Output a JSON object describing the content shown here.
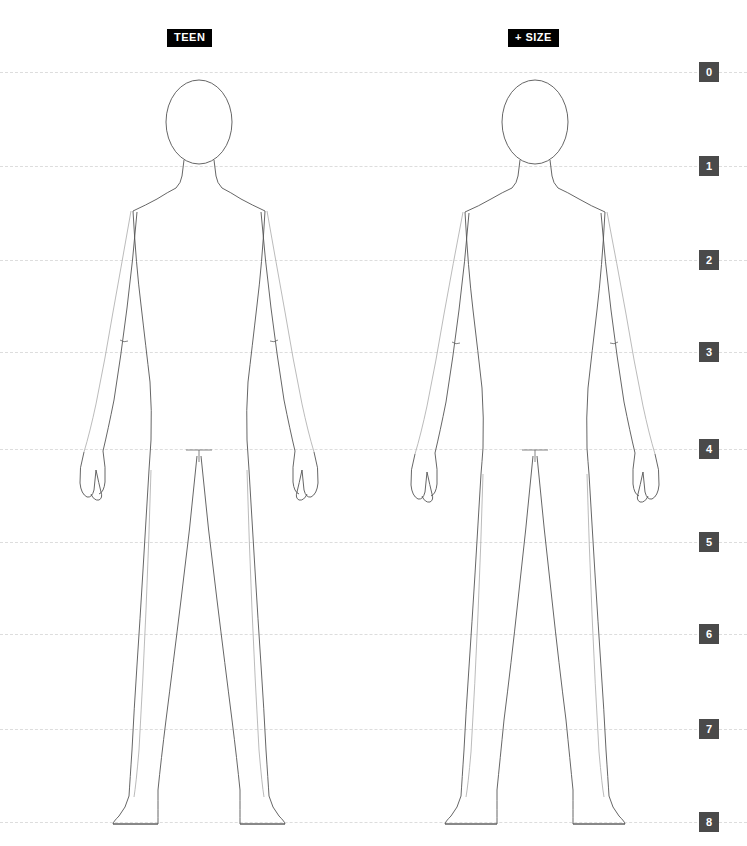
{
  "canvas": {
    "width": 747,
    "height": 846,
    "background": "#ffffff"
  },
  "style": {
    "marker_bg": "#4a4a4a",
    "marker_text": "#ffffff",
    "badge_bg": "#000000",
    "badge_text": "#ffffff",
    "gridline_color": "#dddddd",
    "outline_color": "#555555",
    "outline_light_color": "#aaaaaa"
  },
  "badges": [
    {
      "label": "TEEN",
      "x": 167,
      "y": 29
    },
    {
      "label": "+ SIZE",
      "x": 508,
      "y": 29
    }
  ],
  "gridlines": [
    {
      "label": "0",
      "y": 72
    },
    {
      "label": "1",
      "y": 166
    },
    {
      "label": "2",
      "y": 260
    },
    {
      "label": "3",
      "y": 352
    },
    {
      "label": "4",
      "y": 449
    },
    {
      "label": "5",
      "y": 542
    },
    {
      "label": "6",
      "y": 634
    },
    {
      "label": "7",
      "y": 729
    },
    {
      "label": "8",
      "y": 822
    }
  ],
  "markers": {
    "x": 699,
    "size": 20
  },
  "figures": [
    {
      "name": "teen-figure",
      "badge": "TEEN",
      "center_x": 199,
      "head_top": 80,
      "foot_bottom": 824
    },
    {
      "name": "plus-size-figure",
      "badge": "+ SIZE",
      "center_x": 535,
      "head_top": 80,
      "foot_bottom": 824
    }
  ]
}
